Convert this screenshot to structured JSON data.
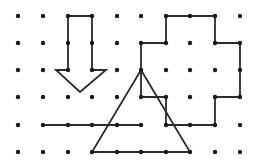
{
  "diagram": {
    "type": "dot-grid-geometry",
    "grid": {
      "columns": 10,
      "rows": 6,
      "col_x": [
        18,
        43,
        68,
        92,
        117,
        141,
        166,
        190,
        215,
        240
      ],
      "row_y": [
        16,
        43,
        70,
        97,
        125,
        152
      ],
      "dot_color": "#1a1a1a"
    },
    "stroke_color": "#2b2b2b",
    "shapes": [
      {
        "name": "down-arrow",
        "kind": "polygon",
        "points": [
          [
            68,
            16
          ],
          [
            92,
            16
          ],
          [
            92,
            70
          ],
          [
            106,
            70
          ],
          [
            80,
            92
          ],
          [
            56,
            70
          ],
          [
            68,
            70
          ]
        ]
      },
      {
        "name": "staircase-polygon",
        "kind": "polygon",
        "points": [
          [
            166,
            16
          ],
          [
            215,
            16
          ],
          [
            215,
            43
          ],
          [
            240,
            43
          ],
          [
            240,
            97
          ],
          [
            215,
            97
          ],
          [
            215,
            125
          ],
          [
            166,
            125
          ],
          [
            166,
            97
          ],
          [
            141,
            97
          ],
          [
            141,
            43
          ],
          [
            166,
            43
          ]
        ]
      },
      {
        "name": "triangle",
        "kind": "polygon",
        "points": [
          [
            141,
            70
          ],
          [
            190,
            152
          ],
          [
            92,
            152
          ]
        ]
      },
      {
        "name": "horizontal-segment",
        "kind": "line",
        "points": [
          [
            43,
            125
          ],
          [
            141,
            125
          ]
        ]
      }
    ]
  }
}
